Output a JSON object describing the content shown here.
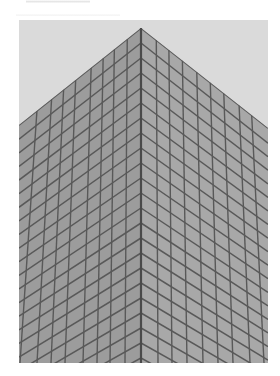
{
  "image": {
    "subject": "glass curtain-wall skyscraper corner viewed from below",
    "frame": {
      "x": 19,
      "y": 20,
      "width": 249,
      "height": 343
    },
    "colors": {
      "sky": "#dadada",
      "left_face": "#9c9c9c",
      "right_face": "#a8a8a8",
      "mullion": "#595959",
      "corner_edge": "#4a4a4a"
    },
    "geometry": {
      "apex": {
        "x": 122,
        "y": 8
      },
      "left_roof_end": {
        "x": 0,
        "y": 105
      },
      "right_roof_end": {
        "x": 249,
        "y": 108
      },
      "corner_bottom": {
        "x": 122,
        "y": 343
      },
      "left_verticals_top": [
        0,
        22,
        45,
        70,
        81,
        94,
        108
      ],
      "left_verticals_bottom": [
        1,
        18,
        32,
        46,
        64,
        78,
        91,
        106
      ],
      "right_verticals_top": [
        136,
        149,
        162,
        174,
        190,
        212,
        235
      ],
      "right_verticals_bottom": [
        139,
        153,
        168,
        184,
        199,
        214,
        231,
        245
      ],
      "corner_horizontal_start_y": 8,
      "corner_horizontal_step": 15,
      "corner_horizontal_count": 23,
      "left_slope_top": 0.8,
      "left_slope_bottom": 0.55,
      "right_slope_top": 0.8,
      "right_slope_bottom": 0.55
    }
  },
  "caption": {
    "visible": "cropped — only bottom edge of text glyphs visible"
  }
}
